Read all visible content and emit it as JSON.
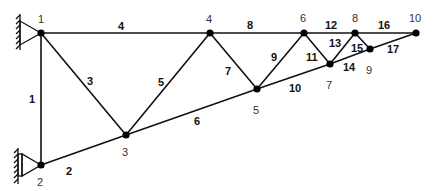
{
  "diagram": {
    "type": "truss",
    "supports": [
      {
        "node": "1",
        "kind": "pin-wall"
      },
      {
        "node": "2",
        "kind": "pin-wall"
      }
    ],
    "nodes": [
      {
        "id": "1",
        "x": 41,
        "y": 33,
        "label": "1",
        "lx": 38,
        "ly": 23
      },
      {
        "id": "2",
        "x": 41,
        "y": 165,
        "label": "2",
        "lx": 37,
        "ly": 186
      },
      {
        "id": "3",
        "x": 126,
        "y": 135,
        "label": "3",
        "lx": 122,
        "ly": 156
      },
      {
        "id": "4",
        "x": 210,
        "y": 33,
        "label": "4",
        "lx": 206,
        "ly": 23
      },
      {
        "id": "5",
        "x": 257,
        "y": 89,
        "label": "5",
        "lx": 253,
        "ly": 114
      },
      {
        "id": "6",
        "x": 304,
        "y": 33,
        "label": "6",
        "lx": 300,
        "ly": 22
      },
      {
        "id": "7",
        "x": 330,
        "y": 64,
        "label": "7",
        "lx": 326,
        "ly": 89
      },
      {
        "id": "8",
        "x": 355,
        "y": 33,
        "label": "8",
        "lx": 352,
        "ly": 22
      },
      {
        "id": "9",
        "x": 370,
        "y": 49,
        "label": "9",
        "lx": 366,
        "ly": 74
      },
      {
        "id": "10",
        "x": 416,
        "y": 33,
        "label": "10",
        "lx": 409,
        "ly": 22
      }
    ],
    "members": [
      {
        "id": "1",
        "from": "1",
        "to": "2",
        "label": "1",
        "lx": 29,
        "ly": 103
      },
      {
        "id": "2",
        "from": "2",
        "to": "3",
        "label": "2",
        "lx": 66,
        "ly": 175
      },
      {
        "id": "3",
        "from": "1",
        "to": "3",
        "label": "3",
        "lx": 87,
        "ly": 85
      },
      {
        "id": "4",
        "from": "1",
        "to": "4",
        "label": "4",
        "lx": 118,
        "ly": 30
      },
      {
        "id": "5",
        "from": "3",
        "to": "4",
        "label": "5",
        "lx": 158,
        "ly": 86
      },
      {
        "id": "6",
        "from": "3",
        "to": "5",
        "label": "6",
        "lx": 194,
        "ly": 125
      },
      {
        "id": "7",
        "from": "4",
        "to": "5",
        "label": "7",
        "lx": 225,
        "ly": 75
      },
      {
        "id": "8",
        "from": "4",
        "to": "6",
        "label": "8",
        "lx": 247,
        "ly": 29
      },
      {
        "id": "9",
        "from": "5",
        "to": "6",
        "label": "9",
        "lx": 271,
        "ly": 61
      },
      {
        "id": "10",
        "from": "5",
        "to": "7",
        "label": "10",
        "lx": 289,
        "ly": 92
      },
      {
        "id": "11",
        "from": "6",
        "to": "7",
        "label": "11",
        "lx": 306,
        "ly": 61
      },
      {
        "id": "12",
        "from": "6",
        "to": "8",
        "label": "12",
        "lx": 325,
        "ly": 29
      },
      {
        "id": "13",
        "from": "7",
        "to": "8",
        "label": "13",
        "lx": 329,
        "ly": 47
      },
      {
        "id": "14",
        "from": "7",
        "to": "9",
        "label": "14",
        "lx": 343,
        "ly": 71
      },
      {
        "id": "15",
        "from": "8",
        "to": "9",
        "label": "15",
        "lx": 351,
        "ly": 52
      },
      {
        "id": "16",
        "from": "8",
        "to": "10",
        "label": "16",
        "lx": 378,
        "ly": 29
      },
      {
        "id": "17",
        "from": "9",
        "to": "10",
        "label": "17",
        "lx": 387,
        "ly": 53
      }
    ]
  }
}
